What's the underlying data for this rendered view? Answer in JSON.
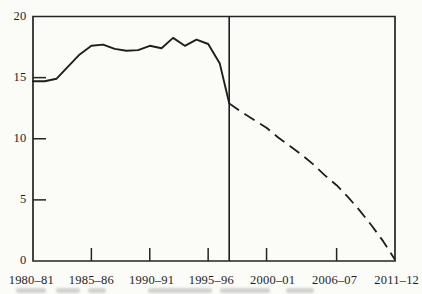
{
  "figure": {
    "background_color": "#fbfbf8",
    "ink_color": "#222222"
  },
  "chart_data": {
    "type": "line",
    "title": "",
    "xlabel": "",
    "ylabel": "",
    "grid": false,
    "legend": "none",
    "x_axis": {
      "tick_labels": [
        "1980–81",
        "1985–86",
        "1990–91",
        "1995–96",
        "2000–01",
        "2006–07",
        "2011–12"
      ],
      "tick_years": [
        1980,
        1985,
        1990,
        1995,
        2000,
        2006,
        2011
      ],
      "range_years": [
        1980,
        2011
      ]
    },
    "y_axis": {
      "ticks": [
        20,
        15,
        10,
        5,
        0
      ],
      "range": [
        0,
        20
      ]
    },
    "divider_year": 1996.8,
    "series": [
      {
        "name": "actual",
        "style": "solid",
        "points": [
          [
            1980,
            14.7
          ],
          [
            1981,
            14.7
          ],
          [
            1982,
            14.9
          ],
          [
            1983,
            15.9
          ],
          [
            1984,
            16.9
          ],
          [
            1985,
            17.6
          ],
          [
            1986,
            17.7
          ],
          [
            1987,
            17.35
          ],
          [
            1988,
            17.2
          ],
          [
            1989,
            17.25
          ],
          [
            1990,
            17.6
          ],
          [
            1991,
            17.4
          ],
          [
            1992,
            18.25
          ],
          [
            1993,
            17.6
          ],
          [
            1994,
            18.1
          ],
          [
            1995,
            17.75
          ],
          [
            1996,
            16.15
          ],
          [
            1996.8,
            12.9
          ]
        ]
      },
      {
        "name": "projected",
        "style": "dashed",
        "points": [
          [
            1996.8,
            12.9
          ],
          [
            1997,
            12.75
          ],
          [
            1998,
            12.1
          ],
          [
            1999,
            11.5
          ],
          [
            2000,
            10.9
          ],
          [
            2001,
            10.1
          ],
          [
            2002,
            9.4
          ],
          [
            2003,
            8.7
          ],
          [
            2004,
            7.9
          ],
          [
            2005,
            7.0
          ],
          [
            2006,
            6.2
          ],
          [
            2007,
            5.2
          ],
          [
            2008,
            4.1
          ],
          [
            2009,
            2.9
          ],
          [
            2010,
            1.6
          ],
          [
            2011,
            0.1
          ]
        ]
      }
    ]
  }
}
